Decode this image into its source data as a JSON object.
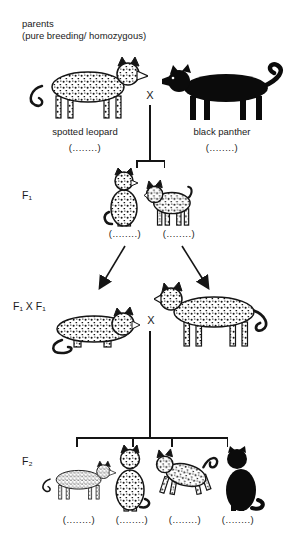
{
  "header": {
    "line1": "parents",
    "line2": "(pure breeding/ homozygous)"
  },
  "parents": {
    "cross": "X",
    "left": {
      "label": "spotted leopard",
      "blank": "(........)"
    },
    "right": {
      "label": "black panther",
      "blank": "(........)"
    }
  },
  "f1": {
    "label": "F₁",
    "blanks": [
      "(........)",
      "(........)"
    ]
  },
  "f1xf1": {
    "label": "F₁ X F₁",
    "cross": "X"
  },
  "f2": {
    "label": "F₂",
    "blanks": [
      "(........)",
      "(........)",
      "(........)",
      "(........)"
    ]
  },
  "colors": {
    "ink": "#1a1a1a",
    "spot": "#151515",
    "panther": "#0b0b0b",
    "background": "#ffffff"
  }
}
